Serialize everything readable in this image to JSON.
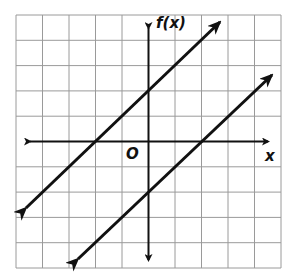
{
  "graph": {
    "y_axis_label": "f(x)",
    "x_axis_label": "x",
    "origin_label": "O",
    "grid": {
      "columns": 10,
      "rows": 10,
      "color": "#9a9a9a"
    },
    "line_color": "#111111",
    "lines": [
      {
        "name": "upper-line",
        "slope": 1,
        "y_intercept": 2,
        "x_intercept": -2
      },
      {
        "name": "lower-line",
        "slope": 1,
        "y_intercept": -2,
        "x_intercept": 2
      }
    ]
  }
}
